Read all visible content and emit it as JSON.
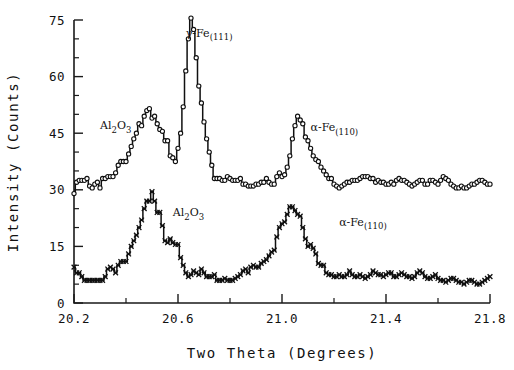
{
  "chart_data": {
    "type": "line",
    "title": "",
    "xlabel": "Two Theta (Degrees)",
    "ylabel": "Intensity (Counts)",
    "xlim": [
      20.2,
      21.8
    ],
    "ylim": [
      0,
      75
    ],
    "grid": false,
    "legend": "none",
    "xticks": [
      20.2,
      20.6,
      21.0,
      21.4,
      21.8
    ],
    "xticklabels": [
      "20.2",
      "20.6",
      "21.0",
      "21.4",
      "21.8"
    ],
    "xtick_minor_step": 0.2,
    "yticks": [
      0,
      15,
      30,
      45,
      60,
      75
    ],
    "yticklabels": [
      "0",
      "15",
      "30",
      "45",
      "60",
      "75"
    ],
    "ytick_minor_step": 5,
    "annotations": [
      {
        "id": "gamma-fe-111-upper",
        "text": "γ-Fe",
        "sub": "(111)",
        "x": 20.63,
        "y": 70.5
      },
      {
        "id": "al2o3-upper",
        "text": "Al",
        "sub": "2",
        "text2": "O",
        "sub2": "3",
        "x": 20.3,
        "y": 46.0
      },
      {
        "id": "alpha-fe-110-upper",
        "text": "α-Fe",
        "sub": "(110)",
        "x": 21.11,
        "y": 45.5
      },
      {
        "id": "al2o3-lower",
        "text": "Al",
        "sub": "2",
        "text2": "O",
        "sub2": "3",
        "x": 20.58,
        "y": 23.0
      },
      {
        "id": "alpha-fe-110-lower",
        "text": "α-Fe",
        "sub": "(110)",
        "x": 21.22,
        "y": 20.5
      }
    ],
    "series": [
      {
        "name": "upper-trace",
        "marker": "open-circle",
        "x": [
          20.2,
          20.21,
          20.22,
          20.23,
          20.24,
          20.25,
          20.26,
          20.27,
          20.28,
          20.29,
          20.3,
          20.31,
          20.32,
          20.33,
          20.34,
          20.35,
          20.36,
          20.37,
          20.38,
          20.39,
          20.4,
          20.41,
          20.42,
          20.43,
          20.44,
          20.45,
          20.46,
          20.47,
          20.48,
          20.49,
          20.5,
          20.51,
          20.52,
          20.53,
          20.54,
          20.55,
          20.56,
          20.57,
          20.58,
          20.59,
          20.6,
          20.61,
          20.62,
          20.63,
          20.64,
          20.65,
          20.66,
          20.67,
          20.68,
          20.69,
          20.7,
          20.71,
          20.72,
          20.73,
          20.74,
          20.75,
          20.76,
          20.77,
          20.78,
          20.79,
          20.8,
          20.81,
          20.82,
          20.83,
          20.84,
          20.85,
          20.86,
          20.87,
          20.88,
          20.89,
          20.9,
          20.91,
          20.92,
          20.93,
          20.94,
          20.95,
          20.96,
          20.97,
          20.98,
          20.99,
          21.0,
          21.01,
          21.02,
          21.03,
          21.04,
          21.05,
          21.06,
          21.07,
          21.08,
          21.09,
          21.1,
          21.11,
          21.12,
          21.13,
          21.14,
          21.15,
          21.16,
          21.17,
          21.18,
          21.19,
          21.2,
          21.21,
          21.22,
          21.23,
          21.24,
          21.25,
          21.26,
          21.27,
          21.28,
          21.29,
          21.3,
          21.31,
          21.32,
          21.33,
          21.34,
          21.35,
          21.36,
          21.37,
          21.38,
          21.39,
          21.4,
          21.41,
          21.42,
          21.43,
          21.44,
          21.45,
          21.46,
          21.47,
          21.48,
          21.49,
          21.5,
          21.51,
          21.52,
          21.53,
          21.54,
          21.55,
          21.56,
          21.57,
          21.58,
          21.59,
          21.6,
          21.61,
          21.62,
          21.63,
          21.64,
          21.65,
          21.66,
          21.67,
          21.68,
          21.69,
          21.7,
          21.71,
          21.72,
          21.73,
          21.74,
          21.75,
          21.76,
          21.77,
          21.78,
          21.79,
          21.8
        ],
        "y": [
          29.0,
          32.0,
          32.5,
          32.5,
          32.5,
          33.0,
          31.0,
          30.5,
          31.5,
          32.0,
          30.5,
          33.0,
          33.0,
          33.5,
          33.5,
          33.5,
          34.5,
          36.5,
          37.5,
          37.5,
          37.5,
          39.5,
          41.5,
          43.5,
          45.0,
          47.5,
          47.0,
          49.5,
          51.0,
          51.5,
          49.0,
          49.5,
          47.5,
          46.0,
          45.5,
          43.0,
          43.0,
          39.0,
          38.5,
          37.5,
          41.0,
          45.0,
          52.0,
          61.5,
          70.0,
          75.5,
          72.5,
          65.0,
          57.5,
          53.0,
          48.0,
          43.5,
          40.0,
          36.5,
          33.0,
          33.0,
          33.0,
          32.5,
          32.5,
          33.5,
          33.0,
          32.5,
          32.5,
          32.5,
          33.0,
          31.5,
          31.5,
          31.0,
          31.0,
          31.0,
          31.5,
          31.5,
          32.0,
          32.0,
          33.0,
          32.0,
          31.5,
          31.5,
          33.5,
          34.5,
          33.5,
          34.0,
          36.0,
          39.0,
          43.5,
          47.0,
          49.5,
          48.5,
          47.5,
          44.0,
          43.0,
          41.0,
          39.0,
          38.0,
          37.5,
          36.0,
          35.0,
          34.0,
          33.0,
          33.0,
          31.5,
          31.0,
          30.5,
          31.0,
          31.5,
          32.0,
          32.0,
          32.5,
          32.5,
          32.5,
          33.0,
          33.5,
          33.5,
          33.5,
          33.0,
          33.0,
          32.0,
          32.5,
          32.0,
          32.0,
          31.5,
          31.5,
          32.0,
          31.5,
          32.5,
          33.0,
          32.5,
          32.5,
          32.0,
          31.5,
          31.0,
          31.5,
          32.0,
          32.5,
          32.5,
          31.5,
          31.5,
          32.5,
          32.5,
          32.0,
          31.5,
          32.5,
          33.5,
          33.0,
          32.5,
          31.5,
          31.0,
          30.5,
          30.5,
          31.0,
          30.5,
          30.5,
          31.0,
          31.5,
          31.5,
          32.0,
          32.5,
          32.5,
          32.0,
          31.5,
          31.5
        ]
      },
      {
        "name": "lower-trace",
        "marker": "cross",
        "x": [
          20.2,
          20.21,
          20.22,
          20.23,
          20.24,
          20.25,
          20.26,
          20.27,
          20.28,
          20.29,
          20.3,
          20.31,
          20.32,
          20.33,
          20.34,
          20.35,
          20.36,
          20.37,
          20.38,
          20.39,
          20.4,
          20.41,
          20.42,
          20.43,
          20.44,
          20.45,
          20.46,
          20.47,
          20.48,
          20.49,
          20.5,
          20.51,
          20.52,
          20.53,
          20.54,
          20.55,
          20.56,
          20.57,
          20.58,
          20.59,
          20.6,
          20.61,
          20.62,
          20.63,
          20.64,
          20.65,
          20.66,
          20.67,
          20.68,
          20.69,
          20.7,
          20.71,
          20.72,
          20.73,
          20.74,
          20.75,
          20.76,
          20.77,
          20.78,
          20.79,
          20.8,
          20.81,
          20.82,
          20.83,
          20.84,
          20.85,
          20.86,
          20.87,
          20.88,
          20.89,
          20.9,
          20.91,
          20.92,
          20.93,
          20.94,
          20.95,
          20.96,
          20.97,
          20.98,
          20.99,
          21.0,
          21.01,
          21.02,
          21.03,
          21.04,
          21.05,
          21.06,
          21.07,
          21.08,
          21.09,
          21.1,
          21.11,
          21.12,
          21.13,
          21.14,
          21.15,
          21.16,
          21.17,
          21.18,
          21.19,
          21.2,
          21.21,
          21.22,
          21.23,
          21.24,
          21.25,
          21.26,
          21.27,
          21.28,
          21.29,
          21.3,
          21.31,
          21.32,
          21.33,
          21.34,
          21.35,
          21.36,
          21.37,
          21.38,
          21.39,
          21.4,
          21.41,
          21.42,
          21.43,
          21.44,
          21.45,
          21.46,
          21.47,
          21.48,
          21.49,
          21.5,
          21.51,
          21.52,
          21.53,
          21.54,
          21.55,
          21.56,
          21.57,
          21.58,
          21.59,
          21.6,
          21.61,
          21.62,
          21.63,
          21.64,
          21.65,
          21.66,
          21.67,
          21.68,
          21.69,
          21.7,
          21.71,
          21.72,
          21.73,
          21.74,
          21.75,
          21.76,
          21.77,
          21.78,
          21.79,
          21.8
        ],
        "y": [
          9.5,
          8.0,
          8.0,
          7.0,
          6.0,
          6.0,
          6.0,
          6.0,
          6.0,
          6.0,
          6.0,
          6.0,
          7.0,
          9.0,
          9.5,
          9.0,
          8.0,
          10.0,
          11.0,
          11.0,
          11.0,
          13.0,
          15.0,
          16.5,
          18.0,
          20.0,
          22.0,
          25.0,
          27.0,
          27.0,
          29.5,
          27.0,
          24.0,
          24.0,
          20.5,
          16.5,
          16.0,
          17.0,
          16.0,
          15.5,
          15.5,
          12.0,
          10.0,
          8.0,
          7.0,
          7.5,
          8.5,
          8.0,
          7.5,
          9.0,
          8.0,
          7.0,
          7.0,
          7.0,
          7.5,
          6.0,
          6.0,
          6.0,
          6.5,
          6.0,
          6.0,
          6.0,
          6.5,
          7.0,
          7.5,
          8.5,
          9.0,
          8.0,
          9.5,
          10.0,
          9.5,
          9.5,
          10.5,
          11.0,
          11.5,
          12.5,
          13.5,
          14.0,
          17.5,
          20.0,
          21.0,
          21.5,
          23.5,
          25.5,
          25.5,
          24.5,
          23.5,
          23.0,
          20.0,
          17.0,
          15.0,
          15.5,
          14.5,
          13.0,
          10.5,
          10.0,
          10.0,
          8.0,
          7.5,
          7.5,
          7.0,
          7.0,
          7.5,
          7.0,
          7.0,
          7.5,
          8.5,
          7.5,
          7.0,
          7.0,
          7.5,
          7.0,
          6.5,
          7.0,
          7.5,
          8.5,
          8.0,
          7.5,
          7.5,
          7.0,
          7.5,
          8.0,
          8.0,
          7.0,
          7.0,
          7.5,
          8.0,
          7.5,
          7.0,
          7.0,
          6.5,
          7.0,
          8.0,
          8.5,
          8.0,
          7.0,
          6.5,
          6.5,
          7.0,
          7.5,
          6.5,
          6.0,
          6.0,
          5.5,
          6.0,
          6.5,
          6.5,
          6.0,
          5.5,
          5.5,
          5.0,
          5.5,
          6.0,
          6.0,
          5.5,
          5.0,
          5.0,
          5.5,
          6.0,
          6.5,
          7.0
        ]
      }
    ]
  }
}
